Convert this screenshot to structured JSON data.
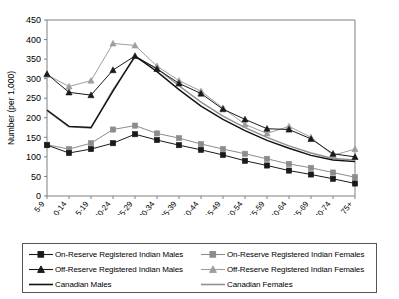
{
  "chart_data": {
    "type": "line",
    "title": "",
    "xlabel": "Age Group in 1996",
    "ylabel": "Number (per 1,000)",
    "ylim": [
      0,
      450
    ],
    "ytick_step": 50,
    "yticks": [
      0,
      50,
      100,
      150,
      200,
      250,
      300,
      350,
      400,
      450
    ],
    "grid": false,
    "legend_position": "bottom",
    "categories": [
      "5-9",
      "10-14",
      "15-19",
      "20-24",
      "25-29",
      "30-34",
      "35-39",
      "40-44",
      "45-49",
      "50-54",
      "55-59",
      "60-64",
      "65-69",
      "70-74",
      "75+"
    ],
    "series": [
      {
        "name": "On-Reserve Registered Indian Males",
        "marker": "square",
        "color": "#1a1a1a",
        "values": [
          130,
          110,
          120,
          135,
          158,
          143,
          130,
          118,
          105,
          90,
          78,
          65,
          55,
          44,
          32
        ]
      },
      {
        "name": "On-Reserve Registered Indian Females",
        "marker": "square",
        "color": "#8c8c8c",
        "values": [
          131,
          120,
          135,
          170,
          180,
          160,
          148,
          133,
          120,
          108,
          95,
          82,
          72,
          60,
          48
        ]
      },
      {
        "name": "Off-Reserve Registered Indian Males",
        "marker": "triangle",
        "color": "#1a1a1a",
        "values": [
          312,
          265,
          258,
          322,
          358,
          325,
          288,
          262,
          222,
          196,
          172,
          170,
          146,
          108,
          100
        ]
      },
      {
        "name": "Off-Reserve Registered Indian Females",
        "marker": "triangle",
        "color": "#9e9e9e",
        "values": [
          310,
          280,
          295,
          390,
          385,
          332,
          295,
          268,
          225,
          183,
          160,
          178,
          150,
          104,
          120
        ]
      },
      {
        "name": "Canadian Males",
        "marker": "none",
        "color": "#111111",
        "values": [
          220,
          178,
          175,
          268,
          358,
          318,
          272,
          230,
          196,
          167,
          142,
          122,
          104,
          92,
          88
        ]
      },
      {
        "name": "Canadian Females",
        "marker": "none",
        "color": "#8f8f8f",
        "values": [
          218,
          177,
          174,
          272,
          355,
          326,
          282,
          240,
          204,
          175,
          150,
          128,
          110,
          96,
          92
        ]
      }
    ]
  },
  "legend": {
    "entries": [
      {
        "label": "On-Reserve Registered Indian Males",
        "marker": "square",
        "color": "#1a1a1a"
      },
      {
        "label": "On-Reserve Registered Indian Females",
        "marker": "square",
        "color": "#8c8c8c"
      },
      {
        "label": "Off-Reserve Registered Indian Males",
        "marker": "triangle",
        "color": "#1a1a1a"
      },
      {
        "label": "Off-Reserve Registered Indian Females",
        "marker": "triangle",
        "color": "#9e9e9e"
      },
      {
        "label": "Canadian Males",
        "marker": "none",
        "color": "#111111"
      },
      {
        "label": "Canadian Females",
        "marker": "none",
        "color": "#8f8f8f"
      }
    ]
  }
}
